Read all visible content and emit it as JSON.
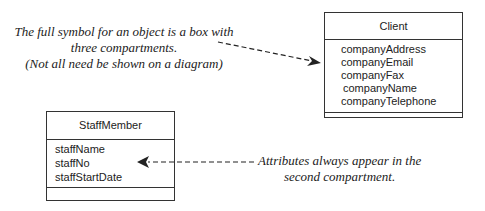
{
  "notes": {
    "object_symbol": {
      "line1": "The full symbol for an object is a box with",
      "line2": "three compartments.",
      "line3": "(Not all need be shown on a diagram)"
    },
    "attributes": {
      "line1": "Attributes always appear in the",
      "line2": "second compartment."
    }
  },
  "classes": {
    "client": {
      "name": "Client",
      "attributes": [
        "companyAddress",
        "companyEmail",
        "companyFax",
        "companyName",
        "companyTelephone"
      ]
    },
    "staff_member": {
      "name": "StaffMember",
      "attributes": [
        "staffName",
        "staffNo",
        "staffStartDate"
      ]
    }
  }
}
